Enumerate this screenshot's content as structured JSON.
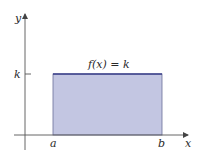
{
  "diagram": {
    "function_label": "f(x) = k",
    "y_axis_label": "y",
    "x_axis_label": "x",
    "k_label": "k",
    "a_label": "a",
    "b_label": "b",
    "colors": {
      "fill": "#c3c6e2",
      "top_edge": "#3a3f8a",
      "axes": "#555555",
      "edges": "#6a6e9a"
    }
  }
}
